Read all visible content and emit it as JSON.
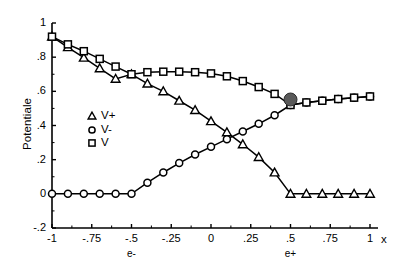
{
  "chart_data": {
    "type": "line",
    "title": "",
    "subtitle": "",
    "xlabel": "x",
    "ylabel": "Potentiale",
    "xlim": [
      -1,
      1
    ],
    "ylim": [
      -0.2,
      1.0
    ],
    "grid": false,
    "legend_position": "inside-left",
    "x_ticks": [
      "-1",
      "-.75",
      "-.5",
      "-.25",
      "0",
      ".25",
      ".5",
      ".75",
      "1"
    ],
    "x_tick_values": [
      -1,
      -0.75,
      -0.5,
      -0.25,
      0,
      0.25,
      0.5,
      0.75,
      1
    ],
    "y_ticks": [
      "1",
      ".8",
      ".6",
      ".4",
      ".2",
      "0",
      "-.2"
    ],
    "y_tick_values": [
      1,
      0.8,
      0.6,
      0.4,
      0.2,
      0,
      -0.2
    ],
    "annotations": [
      {
        "text": "e-",
        "x": -0.5,
        "axis": "x",
        "note": "marker label below -.5 tick"
      },
      {
        "text": "e+",
        "x": 0.5,
        "axis": "x",
        "note": "marker label below .5 tick"
      }
    ],
    "highlight_point": {
      "label": "V minimum",
      "x": 0.5,
      "y": 0.52,
      "marker": "filled-circle",
      "color": "#595959"
    },
    "x": [
      -1,
      -0.9,
      -0.8,
      -0.7,
      -0.6,
      -0.5,
      -0.4,
      -0.3,
      -0.2,
      -0.1,
      0,
      0.1,
      0.2,
      0.3,
      0.4,
      0.5,
      0.6,
      0.7,
      0.8,
      0.9,
      1
    ],
    "series": [
      {
        "name": "V+",
        "marker": "triangle",
        "filled": false,
        "color": "#000000",
        "values": [
          0.92,
          0.858,
          0.797,
          0.735,
          0.673,
          0.7,
          0.645,
          0.6,
          0.545,
          0.49,
          0.425,
          0.36,
          0.29,
          0.215,
          0.125,
          0.0,
          0.0,
          0.0,
          0.0,
          0.0,
          0.0
        ]
      },
      {
        "name": "V-",
        "marker": "circle",
        "filled": false,
        "color": "#000000",
        "values": [
          0.0,
          0.0,
          0.0,
          0.0,
          0.0,
          0.0,
          0.065,
          0.125,
          0.18,
          0.23,
          0.275,
          0.32,
          0.365,
          0.41,
          0.46,
          0.52,
          0.535,
          0.545,
          0.555,
          0.563,
          0.57
        ]
      },
      {
        "name": "V",
        "marker": "square",
        "filled": false,
        "color": "#000000",
        "values": [
          0.92,
          0.875,
          0.835,
          0.79,
          0.745,
          0.7,
          0.712,
          0.715,
          0.715,
          0.712,
          0.705,
          0.688,
          0.66,
          0.625,
          0.585,
          0.52,
          0.535,
          0.545,
          0.555,
          0.563,
          0.57
        ]
      }
    ],
    "legend_entries": [
      {
        "label": "V+",
        "marker": "triangle"
      },
      {
        "label": "V-",
        "marker": "circle"
      },
      {
        "label": "V",
        "marker": "square"
      }
    ]
  }
}
